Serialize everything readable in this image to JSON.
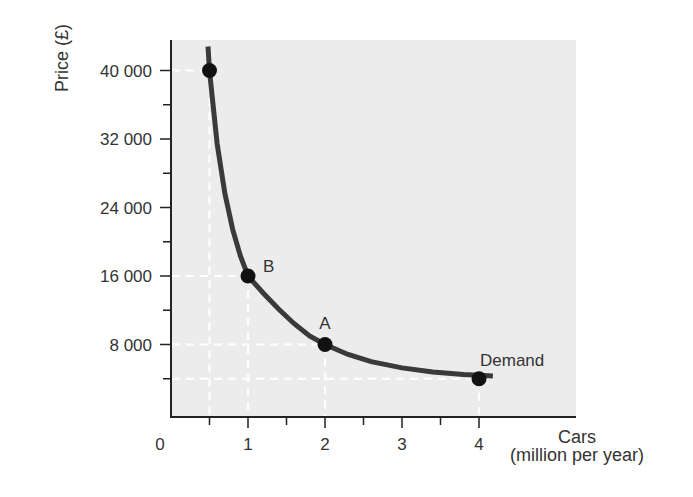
{
  "chart_data": {
    "type": "line",
    "title": "",
    "xlabel": "Cars",
    "xlabel_unit": "(million per year)",
    "ylabel": "Price (£)",
    "xlim": [
      0,
      4.3
    ],
    "ylim": [
      0,
      44000
    ],
    "x_ticks": [
      {
        "value": 0,
        "label": "0"
      },
      {
        "value": 1,
        "label": "1"
      },
      {
        "value": 2,
        "label": "2"
      },
      {
        "value": 3,
        "label": "3"
      },
      {
        "value": 4,
        "label": "4"
      }
    ],
    "x_minor_ticks": [
      0.5,
      1.5,
      2.5,
      3.5
    ],
    "y_ticks": [
      {
        "value": 8000,
        "label": "8 000"
      },
      {
        "value": 16000,
        "label": "16 000"
      },
      {
        "value": 24000,
        "label": "24 000"
      },
      {
        "value": 32000,
        "label": "32 000"
      },
      {
        "value": 40000,
        "label": "40 000"
      }
    ],
    "y_minor_ticks": [
      4000,
      12000,
      20000,
      28000,
      36000
    ],
    "series": [
      {
        "name": "Demand",
        "x": [
          0.5,
          1,
          2,
          4
        ],
        "y": [
          40000,
          16000,
          8000,
          4000
        ],
        "point_labels": [
          "",
          "B",
          "A",
          "Demand"
        ]
      }
    ],
    "grid": false,
    "dashed_guides": true,
    "legend": "none",
    "colors": {
      "plot_background": "#ececec",
      "curve": "#3a3a3a",
      "points": "#111111",
      "guides": "#ffffff",
      "axis": "#222222",
      "text": "#333333"
    }
  }
}
